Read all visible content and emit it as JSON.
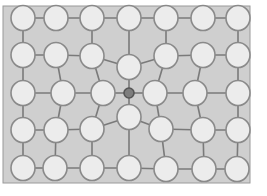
{
  "diagram": {
    "type": "graph",
    "title": "",
    "colors": {
      "background": "#ffffff",
      "frame_fill": "#cfcfcf",
      "frame_stroke": "#9a9a9a",
      "edge": "#7a7a7a",
      "node_fill": "#ececec",
      "node_stroke": "#8a8a8a",
      "center_node_fill": "#7d7d7d"
    },
    "frame": {
      "x": 3,
      "y": 6,
      "width": 247,
      "height": 177
    },
    "node_radius": {
      "rx": 12,
      "ry": 12.5
    },
    "center_node_radius": 5,
    "nodes": [
      {
        "id": "r1c1",
        "x": 23,
        "y": 18
      },
      {
        "id": "r1c2",
        "x": 56,
        "y": 18
      },
      {
        "id": "r1c3",
        "x": 92,
        "y": 18
      },
      {
        "id": "r1c4",
        "x": 129,
        "y": 18
      },
      {
        "id": "r1c5",
        "x": 166,
        "y": 18
      },
      {
        "id": "r1c6",
        "x": 203,
        "y": 18
      },
      {
        "id": "r1c7",
        "x": 238,
        "y": 18
      },
      {
        "id": "r2c1",
        "x": 23,
        "y": 55
      },
      {
        "id": "r2c2",
        "x": 56,
        "y": 55
      },
      {
        "id": "r2c3",
        "x": 92,
        "y": 56
      },
      {
        "id": "r2c4",
        "x": 129,
        "y": 67
      },
      {
        "id": "r2c5",
        "x": 166,
        "y": 56
      },
      {
        "id": "r2c6",
        "x": 203,
        "y": 55
      },
      {
        "id": "r2c7",
        "x": 238,
        "y": 55
      },
      {
        "id": "r3c1",
        "x": 23,
        "y": 93
      },
      {
        "id": "r3c2",
        "x": 63,
        "y": 93
      },
      {
        "id": "r3c3",
        "x": 103,
        "y": 93
      },
      {
        "id": "r3c4",
        "x": 129,
        "y": 93,
        "center": true
      },
      {
        "id": "r3c5",
        "x": 155,
        "y": 93
      },
      {
        "id": "r3c6",
        "x": 195,
        "y": 93
      },
      {
        "id": "r3c7",
        "x": 238,
        "y": 93
      },
      {
        "id": "r4c1",
        "x": 23,
        "y": 130
      },
      {
        "id": "r4c2",
        "x": 56,
        "y": 130
      },
      {
        "id": "r4c3",
        "x": 92,
        "y": 129
      },
      {
        "id": "r4c4",
        "x": 129,
        "y": 117
      },
      {
        "id": "r4c5",
        "x": 161,
        "y": 129
      },
      {
        "id": "r4c6",
        "x": 203,
        "y": 130
      },
      {
        "id": "r4c7",
        "x": 238,
        "y": 130
      },
      {
        "id": "r5c1",
        "x": 23,
        "y": 168
      },
      {
        "id": "r5c2",
        "x": 55,
        "y": 168
      },
      {
        "id": "r5c3",
        "x": 92,
        "y": 168
      },
      {
        "id": "r5c4",
        "x": 129,
        "y": 168
      },
      {
        "id": "r5c5",
        "x": 166,
        "y": 169
      },
      {
        "id": "r5c6",
        "x": 204,
        "y": 169
      },
      {
        "id": "r5c7",
        "x": 237,
        "y": 169
      }
    ],
    "edges": [
      [
        "r1c1",
        "r1c2"
      ],
      [
        "r1c2",
        "r1c3"
      ],
      [
        "r1c3",
        "r1c4"
      ],
      [
        "r1c4",
        "r1c5"
      ],
      [
        "r1c5",
        "r1c6"
      ],
      [
        "r1c6",
        "r1c7"
      ],
      [
        "r2c1",
        "r2c2"
      ],
      [
        "r2c2",
        "r2c3"
      ],
      [
        "r2c3",
        "r2c4"
      ],
      [
        "r2c4",
        "r2c5"
      ],
      [
        "r2c5",
        "r2c6"
      ],
      [
        "r2c6",
        "r2c7"
      ],
      [
        "r3c1",
        "r3c2"
      ],
      [
        "r3c2",
        "r3c3"
      ],
      [
        "r3c3",
        "r3c4"
      ],
      [
        "r3c4",
        "r3c5"
      ],
      [
        "r3c5",
        "r3c6"
      ],
      [
        "r3c6",
        "r3c7"
      ],
      [
        "r4c1",
        "r4c2"
      ],
      [
        "r4c2",
        "r4c3"
      ],
      [
        "r4c3",
        "r4c4"
      ],
      [
        "r4c4",
        "r4c5"
      ],
      [
        "r4c5",
        "r4c6"
      ],
      [
        "r4c6",
        "r4c7"
      ],
      [
        "r5c1",
        "r5c2"
      ],
      [
        "r5c2",
        "r5c3"
      ],
      [
        "r5c3",
        "r5c4"
      ],
      [
        "r5c4",
        "r5c5"
      ],
      [
        "r5c5",
        "r5c6"
      ],
      [
        "r5c6",
        "r5c7"
      ],
      [
        "r1c1",
        "r2c1"
      ],
      [
        "r2c1",
        "r3c1"
      ],
      [
        "r3c1",
        "r4c1"
      ],
      [
        "r4c1",
        "r5c1"
      ],
      [
        "r1c7",
        "r2c7"
      ],
      [
        "r2c7",
        "r3c7"
      ],
      [
        "r3c7",
        "r4c7"
      ],
      [
        "r4c7",
        "r5c7"
      ],
      [
        "r1c3",
        "r2c3"
      ],
      [
        "r1c4",
        "r2c4"
      ],
      [
        "r1c5",
        "r2c5"
      ],
      [
        "r2c2",
        "r3c2"
      ],
      [
        "r2c3",
        "r3c3"
      ],
      [
        "r2c5",
        "r3c5"
      ],
      [
        "r2c6",
        "r3c6"
      ],
      [
        "r2c4",
        "r3c4"
      ],
      [
        "r3c4",
        "r4c4"
      ],
      [
        "r3c2",
        "r4c2"
      ],
      [
        "r3c3",
        "r4c3"
      ],
      [
        "r3c5",
        "r4c5"
      ],
      [
        "r3c6",
        "r4c6"
      ],
      [
        "r4c2",
        "r5c2"
      ],
      [
        "r4c3",
        "r5c3"
      ],
      [
        "r4c4",
        "r5c4"
      ],
      [
        "r4c5",
        "r5c5"
      ],
      [
        "r4c6",
        "r5c6"
      ]
    ]
  }
}
